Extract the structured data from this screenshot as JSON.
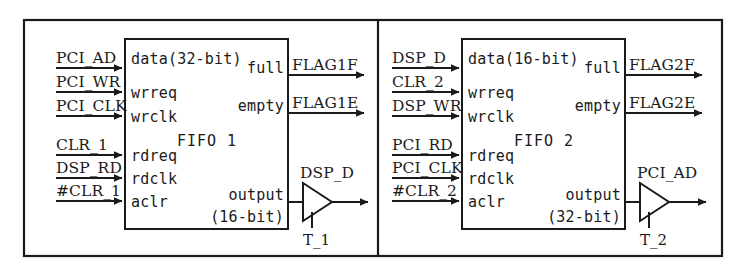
{
  "diagram": {
    "line_color": "#1a1a1a",
    "background": "#ffffff",
    "blocks": [
      {
        "id": "block-1",
        "fifo_label": "FIFO 1",
        "data_port": "data(32-bit)",
        "inputs_upper": [
          {
            "signal": "PCI_AD",
            "port": "data"
          },
          {
            "signal": "PCI_WR",
            "port": "wrreq"
          },
          {
            "signal": "PCI_CLK",
            "port": "wrclk"
          }
        ],
        "inputs_lower": [
          {
            "signal": "CLR_1",
            "port": "rdreq"
          },
          {
            "signal": "DSP_RD",
            "port": "rdclk"
          },
          {
            "signal": "#CLR_1",
            "port": "aclr"
          }
        ],
        "outputs_flags": [
          {
            "port": "full",
            "signal": "FLAG1F"
          },
          {
            "port": "empty",
            "signal": "FLAG1E"
          }
        ],
        "output_port_line1": "output",
        "output_port_line2": "(16-bit)",
        "buffer": {
          "output_signal": "DSP_D",
          "control_signal": "T_1"
        }
      },
      {
        "id": "block-2",
        "fifo_label": "FIFO 2",
        "data_port": "data(16-bit)",
        "inputs_upper": [
          {
            "signal": "DSP_D",
            "port": "data"
          },
          {
            "signal": "CLR_2",
            "port": "wrreq"
          },
          {
            "signal": "DSP_WR",
            "port": "wrclk"
          }
        ],
        "inputs_lower": [
          {
            "signal": "PCI_RD",
            "port": "rdreq"
          },
          {
            "signal": "PCI_CLK",
            "port": "rdclk"
          },
          {
            "signal": "#CLR_2",
            "port": "aclr"
          }
        ],
        "outputs_flags": [
          {
            "port": "full",
            "signal": "FLAG2F"
          },
          {
            "port": "empty",
            "signal": "FLAG2E"
          }
        ],
        "output_port_line1": "output",
        "output_port_line2": "(32-bit)",
        "buffer": {
          "output_signal": "PCI_AD",
          "control_signal": "T_2"
        }
      }
    ]
  }
}
